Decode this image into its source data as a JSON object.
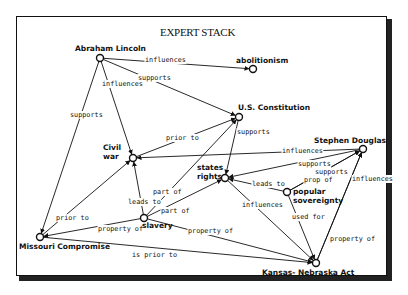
{
  "title": "EXPERT STACK",
  "nodes": [
    {
      "id": "lincoln",
      "label": "Abraham Lincoln",
      "x": 100,
      "y": 58,
      "lx": 75,
      "ly": 51,
      "lines": [
        "Abraham Lincoln"
      ]
    },
    {
      "id": "abolitionism",
      "label": "abolitionism",
      "x": 253,
      "y": 69,
      "lx": 236,
      "ly": 63,
      "lines": [
        "abolitionism"
      ]
    },
    {
      "id": "constitution",
      "label": "U.S. Constitution",
      "x": 239,
      "y": 117,
      "lx": 238,
      "ly": 110,
      "lines": [
        "U.S. Constitution"
      ]
    },
    {
      "id": "civil-war",
      "label": "Civil war",
      "x": 133,
      "y": 158,
      "lx": 103,
      "ly": 150,
      "lines": [
        "Civil",
        "war"
      ]
    },
    {
      "id": "douglas",
      "label": "Stephen Douglas",
      "x": 363,
      "y": 149,
      "lx": 314,
      "ly": 143,
      "lines": [
        "Stephen Douglas"
      ]
    },
    {
      "id": "states-rights",
      "label": "states rights",
      "x": 225,
      "y": 178,
      "lx": 197,
      "ly": 170,
      "lines": [
        "states",
        "rights"
      ]
    },
    {
      "id": "popular-sovereignty",
      "label": "popular sovereignty",
      "x": 287,
      "y": 192,
      "lx": 293,
      "ly": 194,
      "lines": [
        "popular",
        "sovereignty"
      ]
    },
    {
      "id": "slavery",
      "label": "slavery",
      "x": 144,
      "y": 218,
      "lx": 142,
      "ly": 228,
      "lines": [
        "slavery"
      ]
    },
    {
      "id": "missouri",
      "label": "Missouri Compromise",
      "x": 40,
      "y": 237,
      "lx": 19,
      "ly": 249,
      "lines": [
        "Missouri Compromise"
      ]
    },
    {
      "id": "kansas-nebraska",
      "label": "Kansas-Nebraska Act",
      "x": 316,
      "y": 263,
      "lx": 262,
      "ly": 275,
      "lines": [
        "Kansas- Nebraska Act"
      ]
    }
  ],
  "edges": [
    {
      "from": "lincoln",
      "to": "abolitionism",
      "label": "influences",
      "lx": 145,
      "ly": 62
    },
    {
      "from": "lincoln",
      "to": "constitution",
      "label": "supports",
      "lx": 138,
      "ly": 80
    },
    {
      "from": "lincoln",
      "to": "civil-war",
      "label": "influences",
      "lx": 102,
      "ly": 86
    },
    {
      "from": "lincoln",
      "to": "missouri",
      "label": "supports",
      "lx": 70,
      "ly": 117
    },
    {
      "from": "civil-war",
      "to": "constitution",
      "label": "prior to",
      "lx": 166,
      "ly": 140
    },
    {
      "from": "constitution",
      "to": "states-rights",
      "label": "supports",
      "lx": 237,
      "ly": 134
    },
    {
      "from": "douglas",
      "to": "civil-war",
      "label": "influences",
      "lx": 282,
      "ly": 153
    },
    {
      "from": "douglas",
      "to": "states-rights",
      "label": "supports",
      "lx": 298,
      "ly": 166
    },
    {
      "from": "popular-sovereignty",
      "to": "douglas",
      "label": "supports",
      "lx": 315,
      "ly": 174
    },
    {
      "from": "popular-sovereignty",
      "to": "douglas",
      "label": "prop of",
      "lx": 304,
      "ly": 182
    },
    {
      "from": "kansas-nebraska",
      "to": "douglas",
      "label": "influences",
      "lx": 352,
      "ly": 181
    },
    {
      "from": "popular-sovereignty",
      "to": "states-rights",
      "label": "leads to",
      "lx": 252,
      "ly": 186
    },
    {
      "from": "states-rights",
      "to": "kansas-nebraska",
      "label": "influences",
      "lx": 242,
      "ly": 207
    },
    {
      "from": "popular-sovereignty",
      "to": "kansas-nebraska",
      "label": "used for",
      "lx": 292,
      "ly": 219
    },
    {
      "from": "kansas-nebraska",
      "to": "douglas",
      "label": "property of",
      "lx": 330,
      "ly": 241
    },
    {
      "from": "slavery",
      "to": "constitution",
      "label": "part of",
      "lx": 153,
      "ly": 194
    },
    {
      "from": "slavery",
      "to": "states-rights",
      "label": "part of",
      "lx": 161,
      "ly": 213
    },
    {
      "from": "slavery",
      "to": "civil-war",
      "label": "leads to",
      "lx": 128,
      "ly": 204
    },
    {
      "from": "missouri",
      "to": "civil-war",
      "label": "prior to",
      "lx": 56,
      "ly": 220
    },
    {
      "from": "slavery",
      "to": "missouri",
      "label": "property of",
      "lx": 98,
      "ly": 231
    },
    {
      "from": "slavery",
      "to": "kansas-nebraska",
      "label": "property of",
      "lx": 188,
      "ly": 233
    },
    {
      "from": "missouri",
      "to": "kansas-nebraska",
      "label": "is prior to",
      "lx": 132,
      "ly": 257
    }
  ]
}
